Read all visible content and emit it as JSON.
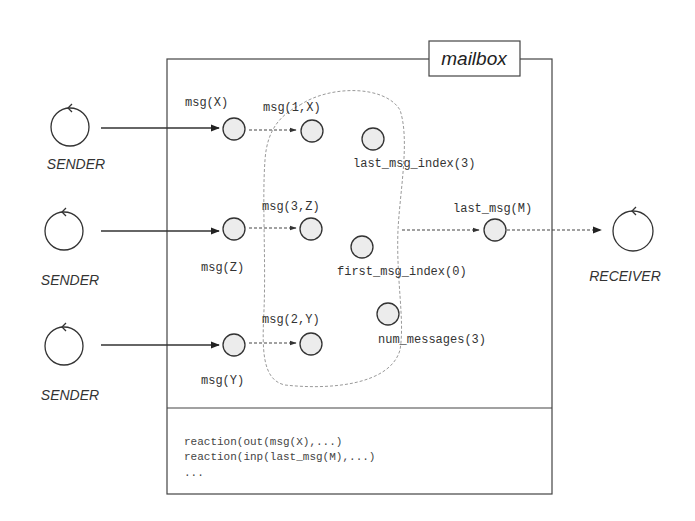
{
  "mailbox": {
    "title": "mailbox",
    "reactions": [
      "reaction(out(msg(X),...)",
      "reaction(inp(last_msg(M),...)",
      "..."
    ]
  },
  "senders": [
    {
      "label": "SENDER",
      "incoming_msg": "msg(X)",
      "indexed_msg": "msg(1,X)"
    },
    {
      "label": "SENDER",
      "incoming_msg": "msg(Z)",
      "indexed_msg": "msg(3,Z)"
    },
    {
      "label": "SENDER",
      "incoming_msg": "msg(Y)",
      "indexed_msg": "msg(2,Y)"
    }
  ],
  "state": {
    "last_msg_index": "last_msg_index(3)",
    "first_msg_index": "first_msg_index(0)",
    "num_messages": "num_messages(3)"
  },
  "output": {
    "last_msg": "last_msg(M)"
  },
  "receiver": {
    "label": "RECEIVER"
  }
}
